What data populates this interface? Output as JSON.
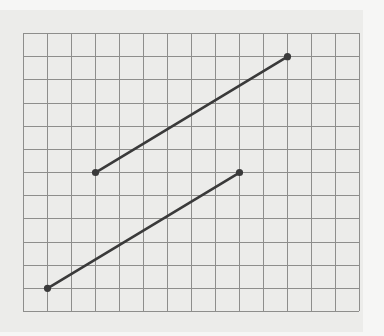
{
  "figure": {
    "title": "Two line segments on a square grid",
    "colors": {
      "page_background": "#f6f6f5",
      "panel_background": "#ececea",
      "grid_line": "#8e8e8c",
      "segment": "#3a3a3a",
      "endpoint": "#3a3a3a"
    },
    "grid": {
      "columns": 14,
      "rows": 12,
      "origin_px": [
        23,
        33
      ],
      "cell_width_px": 24,
      "cell_height_px": 23.17
    },
    "segments": [
      {
        "id": "upper-segment",
        "start": {
          "col": 3,
          "row": 6
        },
        "end": {
          "col": 11,
          "row": 1
        }
      },
      {
        "id": "lower-segment",
        "start": {
          "col": 1,
          "row": 11
        },
        "end": {
          "col": 9,
          "row": 6
        }
      }
    ]
  }
}
